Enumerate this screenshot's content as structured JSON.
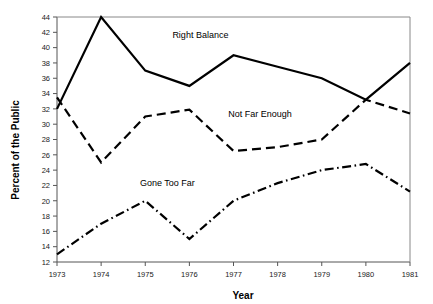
{
  "chart_data": {
    "type": "line",
    "title": "",
    "xlabel": "Year",
    "ylabel": "Percent of the Public",
    "x": [
      1973,
      1974,
      1975,
      1976,
      1977,
      1978,
      1979,
      1980,
      1981
    ],
    "categories": [
      "1973",
      "1974",
      "1975",
      "1976",
      "1977",
      "1978",
      "1979",
      "1980",
      "1981"
    ],
    "xlim": [
      1973,
      1981
    ],
    "ylim": [
      12,
      44
    ],
    "yticks": [
      12,
      14,
      16,
      18,
      20,
      22,
      24,
      26,
      28,
      30,
      32,
      34,
      36,
      38,
      40,
      42,
      44
    ],
    "ytick_labels": [
      "12",
      "14",
      "16",
      "18",
      "20",
      "22",
      "24",
      "26",
      "28",
      "30",
      "32",
      "34",
      "36",
      "38",
      "40",
      "42",
      "44"
    ],
    "xticks": [
      1973,
      1974,
      1975,
      1976,
      1977,
      1978,
      1979,
      1980,
      1981
    ],
    "xtick_labels": [
      "1973",
      "1974",
      "1975",
      "1976",
      "1977",
      "1978",
      "1979",
      "1980",
      "1981"
    ],
    "grid": false,
    "legend_position": "inline-annotations",
    "series": [
      {
        "name": "Right Balance",
        "style": "solid",
        "color": "#000000",
        "values": [
          32,
          44,
          37,
          35,
          39,
          37.5,
          36,
          33.2,
          38
        ],
        "label_x": 1976.25,
        "label_y": 41.2
      },
      {
        "name": "Not Far Enough",
        "style": "dashed",
        "color": "#000000",
        "values": [
          33.5,
          25,
          31,
          31.9,
          26.5,
          27,
          28,
          33.2,
          31.4
        ],
        "label_x": 1977.6,
        "label_y": 31.0
      },
      {
        "name": "Gone Too Far",
        "style": "dash-dot",
        "color": "#000000",
        "values": [
          13,
          17,
          20,
          15,
          20,
          22.3,
          24,
          24.8,
          21.2
        ],
        "label_x": 1975.5,
        "label_y": 21.9
      }
    ]
  },
  "axes": {
    "x_title": "Year",
    "y_title": "Percent of the Public"
  }
}
